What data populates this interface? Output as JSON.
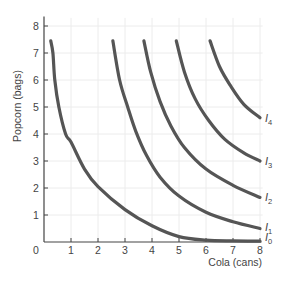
{
  "chart_data": {
    "type": "line",
    "title": "",
    "xlabel": "Cola (cans)",
    "ylabel": "Popcorn (bags)",
    "xlim": [
      0,
      8
    ],
    "ylim": [
      0,
      8
    ],
    "x_ticks": [
      "0",
      "1",
      "2",
      "3",
      "4",
      "5",
      "6",
      "7",
      "8"
    ],
    "y_ticks": [
      "1",
      "2",
      "3",
      "4",
      "5",
      "6",
      "7",
      "8"
    ],
    "grid": true,
    "legend": "inline labels at right end of curves",
    "series": [
      {
        "name": "I0",
        "label_main": "I",
        "label_sub": "0",
        "points": [
          [
            0.25,
            7.45
          ],
          [
            0.33,
            7
          ],
          [
            0.4,
            6
          ],
          [
            0.55,
            5
          ],
          [
            0.8,
            4
          ],
          [
            1,
            3.7
          ],
          [
            1.5,
            2.7
          ],
          [
            2,
            2.05
          ],
          [
            3,
            1.2
          ],
          [
            4,
            0.6
          ],
          [
            5,
            0.2
          ],
          [
            6,
            0.07
          ],
          [
            7,
            0.04
          ],
          [
            8,
            0.03
          ]
        ]
      },
      {
        "name": "I1",
        "label_main": "I",
        "label_sub": "1",
        "points": [
          [
            2.55,
            7.45
          ],
          [
            2.8,
            6
          ],
          [
            3.1,
            5
          ],
          [
            3.4,
            4.1
          ],
          [
            3.8,
            3.2
          ],
          [
            4.3,
            2.4
          ],
          [
            5,
            1.7
          ],
          [
            6,
            1.1
          ],
          [
            7,
            0.75
          ],
          [
            8,
            0.5
          ]
        ]
      },
      {
        "name": "I2",
        "label_main": "I",
        "label_sub": "2",
        "points": [
          [
            3.7,
            7.45
          ],
          [
            3.95,
            6.3
          ],
          [
            4.3,
            5.2
          ],
          [
            4.7,
            4.3
          ],
          [
            5.2,
            3.5
          ],
          [
            6,
            2.7
          ],
          [
            7,
            2.1
          ],
          [
            8,
            1.65
          ]
        ]
      },
      {
        "name": "I3",
        "label_main": "I",
        "label_sub": "3",
        "points": [
          [
            4.9,
            7.45
          ],
          [
            5.2,
            6.3
          ],
          [
            5.6,
            5.3
          ],
          [
            6.1,
            4.5
          ],
          [
            6.7,
            3.8
          ],
          [
            7.4,
            3.3
          ],
          [
            8,
            3.0
          ]
        ]
      },
      {
        "name": "I4",
        "label_main": "I",
        "label_sub": "4",
        "points": [
          [
            6.15,
            7.45
          ],
          [
            6.5,
            6.5
          ],
          [
            6.9,
            5.8
          ],
          [
            7.4,
            5.1
          ],
          [
            8,
            4.6
          ]
        ]
      }
    ]
  },
  "colors": {
    "curve": "#555555",
    "axis": "#444444",
    "grid": "#ececec",
    "text": "#444444"
  }
}
